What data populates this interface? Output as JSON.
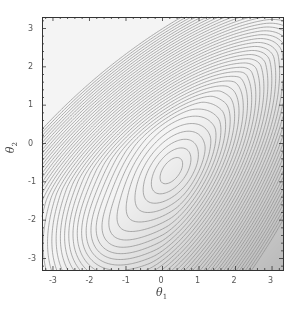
{
  "chart_data": {
    "type": "contour",
    "title": "",
    "xlabel": "θ1",
    "ylabel": "θ2",
    "xlim": [
      -3.3,
      3.3
    ],
    "ylim": [
      -3.3,
      3.3
    ],
    "x_ticks": [
      -3,
      -2,
      -1,
      0,
      1,
      2,
      3
    ],
    "y_ticks": [
      -3,
      -2,
      -1,
      0,
      1,
      2,
      3
    ],
    "x_tick_labels": [
      "-3",
      "-2",
      "-1",
      "0",
      "1",
      "2",
      "3"
    ],
    "y_tick_labels": [
      "-3",
      "-2",
      "-1",
      "0",
      "1",
      "2",
      "3"
    ],
    "grid": false,
    "legend": null,
    "minimum_location": [
      0.25,
      -0.7
    ],
    "contour_count": 40,
    "shading": "lighter near minimum, darker toward bottom-right corner",
    "colors": {
      "background": "#ffffff",
      "fill_light": "#f4f4f4",
      "fill_dark": "#bdbdbd",
      "contour_line": "#8a8a8a",
      "frame": "#333333"
    }
  },
  "axes": {
    "x_title": "θ",
    "x_sub": "1",
    "y_title": "θ",
    "y_sub": "2"
  }
}
